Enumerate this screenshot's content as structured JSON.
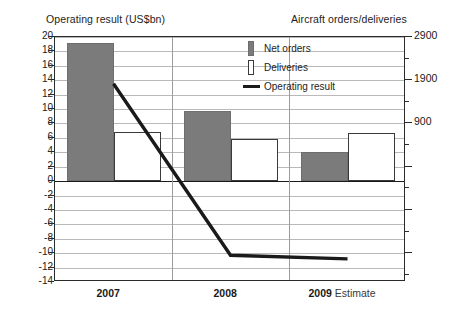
{
  "chart_data": {
    "type": "bar",
    "title": "",
    "categories": [
      "2007",
      "2008",
      "2009"
    ],
    "category_labels": [
      "2007",
      "2008",
      "2009 Estimate"
    ],
    "estimate_note": "Estimate",
    "left_axis": {
      "label": "Operating result (US$bn)",
      "ticks": [
        20,
        18,
        16,
        14,
        12,
        10,
        8,
        6,
        4,
        2,
        0,
        -2,
        -4,
        -6,
        -8,
        -10,
        -12,
        -14
      ],
      "ylim": [
        -14,
        20
      ],
      "step": 2
    },
    "right_axis": {
      "label": "Aircraft orders/deliveries",
      "ticks": [
        2900,
        1900,
        900
      ],
      "tick_labels": [
        "2900",
        "1900",
        "900"
      ],
      "ylim": [
        -4100,
        2900
      ],
      "step": 1000
    },
    "grid": true,
    "legend_position": "top-right",
    "series": [
      {
        "name": "Net orders",
        "type": "bar",
        "axis": "right",
        "color": "#7b7b7b",
        "values": [
          2820,
          1450,
          450
        ],
        "left_scale_heights": [
          19.2,
          9.8,
          4.1
        ]
      },
      {
        "name": "Deliveries",
        "type": "bar",
        "axis": "right",
        "color": "#ffffff",
        "border_color": "#3a3a3a",
        "values": [
          1000,
          840,
          980
        ],
        "left_scale_heights": [
          6.8,
          5.9,
          6.7
        ]
      },
      {
        "name": "Operating result",
        "type": "line",
        "axis": "left",
        "color": "#1a1a1a",
        "values": [
          13.5,
          -10.3,
          -10.8
        ]
      }
    ]
  },
  "legend": {
    "items": [
      {
        "label": "Net orders",
        "swatch": "gray-bar-swatch"
      },
      {
        "label": "Deliveries",
        "swatch": "white-bar-swatch"
      },
      {
        "label": "Operating result",
        "swatch": "black-line-swatch"
      }
    ]
  },
  "colors": {
    "net_orders": "#7b7b7b",
    "deliveries": "#ffffff",
    "operating_result": "#1a1a1a",
    "grid": "#b9b9b9",
    "frame": "#2b2b2b"
  }
}
